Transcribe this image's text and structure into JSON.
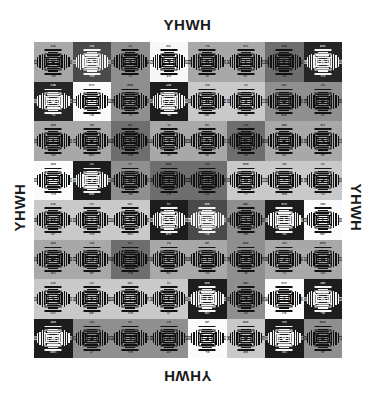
{
  "edge_labels": {
    "top": "YHWH",
    "bottom": "YHWH",
    "left": "YHWH",
    "right": "YHWH"
  },
  "grid": {
    "rows": 8,
    "columns": 8,
    "total_cells": 64,
    "description": "8 by 8 grid of grayscale amulet sigil tiles"
  },
  "palette": {
    "white": "#ffffff",
    "near_white": "#f2f2f2",
    "light_gray": "#c9c9c9",
    "gray": "#a8a8a8",
    "mid_gray": "#8f8f8f",
    "dark_gray": "#6e6e6e",
    "darker_gray": "#4a4a4a",
    "near_black": "#262626",
    "black": "#111111",
    "ink_dark": "#111111",
    "ink_light": "#f5f5f5"
  },
  "cells": [
    {
      "r": 1,
      "c": 1,
      "bg": "#a8a8a8",
      "ink": "#111111",
      "glyph": "א",
      "top": "אבג",
      "bot": "שדי",
      "lnum": "272",
      "rnum": "311"
    },
    {
      "r": 1,
      "c": 2,
      "bg": "#4a4a4a",
      "ink": "#f5f5f5",
      "glyph": "ב",
      "top": "גדה",
      "bot": "אלד",
      "lnum": "118",
      "rnum": "205"
    },
    {
      "r": 1,
      "c": 3,
      "bg": "#8f8f8f",
      "ink": "#111111",
      "glyph": "ג",
      "top": "הוז",
      "bot": "רבי",
      "lnum": "231",
      "rnum": "146"
    },
    {
      "r": 1,
      "c": 4,
      "bg": "#f7f7f7",
      "ink": "#111111",
      "glyph": "ד",
      "top": "זחט",
      "bot": "טיט",
      "lnum": "119",
      "rnum": "333"
    },
    {
      "r": 1,
      "c": 5,
      "bg": "#a8a8a8",
      "ink": "#111111",
      "glyph": "ה",
      "top": "טיכ",
      "bot": "עב",
      "lnum": "214",
      "rnum": "187"
    },
    {
      "r": 1,
      "c": 6,
      "bg": "#a8a8a8",
      "ink": "#111111",
      "glyph": "ו",
      "top": "כלמ",
      "bot": "יזא",
      "lnum": "260",
      "rnum": "172"
    },
    {
      "r": 1,
      "c": 7,
      "bg": "#6e6e6e",
      "ink": "#111111",
      "glyph": "ז",
      "top": "מנס",
      "bot": "נוכ",
      "lnum": "188",
      "rnum": "226"
    },
    {
      "r": 1,
      "c": 8,
      "bg": "#262626",
      "ink": "#f5f5f5",
      "glyph": "ח",
      "top": "סעפ",
      "bot": "הדר",
      "lnum": "141",
      "rnum": "290"
    },
    {
      "r": 2,
      "c": 1,
      "bg": "#262626",
      "ink": "#f5f5f5",
      "glyph": "ט",
      "top": "פצק",
      "bot": "ברי",
      "lnum": "203",
      "rnum": "155"
    },
    {
      "r": 2,
      "c": 2,
      "bg": "#fbfbfb",
      "ink": "#111111",
      "glyph": "י",
      "top": "קרש",
      "bot": "אלו",
      "lnum": "170",
      "rnum": "238"
    },
    {
      "r": 2,
      "c": 3,
      "bg": "#8f8f8f",
      "ink": "#111111",
      "glyph": "כ",
      "top": "שתא",
      "bot": "ולי",
      "lnum": "246",
      "rnum": "193"
    },
    {
      "r": 2,
      "c": 4,
      "bg": "#1d1d1d",
      "ink": "#f5f5f5",
      "glyph": "ל",
      "top": "אבג",
      "bot": "עכי",
      "lnum": "137",
      "rnum": "284"
    },
    {
      "r": 2,
      "c": 5,
      "bg": "#c9c9c9",
      "ink": "#111111",
      "glyph": "מ",
      "top": "גדה",
      "bot": "ישא",
      "lnum": "221",
      "rnum": "164"
    },
    {
      "r": 2,
      "c": 6,
      "bg": "#c9c9c9",
      "ink": "#111111",
      "glyph": "נ",
      "top": "הוז",
      "bot": "צב",
      "lnum": "199",
      "rnum": "275"
    },
    {
      "r": 2,
      "c": 7,
      "bg": "#8f8f8f",
      "ink": "#111111",
      "glyph": "ס",
      "top": "זחט",
      "bot": "אנפ",
      "lnum": "158",
      "rnum": "212"
    },
    {
      "r": 2,
      "c": 8,
      "bg": "#8f8f8f",
      "ink": "#111111",
      "glyph": "ע",
      "top": "טיכ",
      "bot": "והו",
      "lnum": "234",
      "rnum": "180"
    },
    {
      "r": 3,
      "c": 1,
      "bg": "#a8a8a8",
      "ink": "#111111",
      "glyph": "ו",
      "top": "אתג",
      "bot": "האל",
      "lnum": "230",
      "rnum": "191"
    },
    {
      "r": 3,
      "c": 2,
      "bg": "#a8a8a8",
      "ink": "#111111",
      "glyph": "א",
      "top": "שגי",
      "bot": "רתא",
      "lnum": "176",
      "rnum": "243"
    },
    {
      "r": 3,
      "c": 3,
      "bg": "#6e6e6e",
      "ink": "#111111",
      "glyph": "ב",
      "top": "בפו",
      "bot": "אלד",
      "lnum": "264",
      "rnum": "149"
    },
    {
      "r": 3,
      "c": 4,
      "bg": "#a8a8a8",
      "ink": "#111111",
      "glyph": "ד",
      "top": "נגי",
      "bot": "לתי",
      "lnum": "207",
      "rnum": "268"
    },
    {
      "r": 3,
      "c": 5,
      "bg": "#a8a8a8",
      "ink": "#111111",
      "glyph": "ה",
      "top": "ינא",
      "bot": "לאי",
      "lnum": "183",
      "rnum": "225"
    },
    {
      "r": 3,
      "c": 6,
      "bg": "#6e6e6e",
      "ink": "#111111",
      "glyph": "ה",
      "top": "צבה",
      "bot": "ונה",
      "lnum": "251",
      "rnum": "166"
    },
    {
      "r": 3,
      "c": 7,
      "bg": "#a8a8a8",
      "ink": "#111111",
      "glyph": "א",
      "top": "אמג",
      "bot": "הוג",
      "lnum": "195",
      "rnum": "239"
    },
    {
      "r": 3,
      "c": 8,
      "bg": "#a8a8a8",
      "ink": "#111111",
      "glyph": "כ",
      "top": "דוא",
      "bot": "ישד",
      "lnum": "228",
      "rnum": "173"
    },
    {
      "r": 4,
      "c": 1,
      "bg": "#fbfbfb",
      "ink": "#111111",
      "glyph": "י",
      "top": "אתג",
      "bot": "אלד",
      "lnum": "139",
      "rnum": "216"
    },
    {
      "r": 4,
      "c": 2,
      "bg": "#1d1d1d",
      "ink": "#f5f5f5",
      "glyph": "ל",
      "top": "הוז",
      "bot": "מנס",
      "lnum": "248",
      "rnum": "161"
    },
    {
      "r": 4,
      "c": 3,
      "bg": "#8f8f8f",
      "ink": "#111111",
      "glyph": "מ",
      "top": "יכל",
      "bot": "שור",
      "lnum": "211",
      "rnum": "257"
    },
    {
      "r": 4,
      "c": 4,
      "bg": "#6e6e6e",
      "ink": "#111111",
      "glyph": "נ",
      "top": "סעפ",
      "bot": "איל",
      "lnum": "186",
      "rnum": "229"
    },
    {
      "r": 4,
      "c": 5,
      "bg": "#6e6e6e",
      "ink": "#111111",
      "glyph": "ה",
      "top": "צקר",
      "bot": "יהוה",
      "lnum": "254",
      "rnum": "147"
    },
    {
      "r": 4,
      "c": 6,
      "bg": "#c9c9c9",
      "ink": "#111111",
      "glyph": "מ",
      "top": "שתא",
      "bot": "רזי",
      "lnum": "192",
      "rnum": "271"
    },
    {
      "r": 4,
      "c": 7,
      "bg": "#c9c9c9",
      "ink": "#111111",
      "glyph": "י",
      "top": "בגד",
      "bot": "אשד",
      "lnum": "218",
      "rnum": "168"
    },
    {
      "r": 4,
      "c": 8,
      "bg": "#c9c9c9",
      "ink": "#111111",
      "glyph": "כ",
      "top": "הוו",
      "bot": "ובר",
      "lnum": "241",
      "rnum": "200"
    },
    {
      "r": 5,
      "c": 1,
      "bg": "#c9c9c9",
      "ink": "#111111",
      "glyph": "ש",
      "top": "אבג",
      "bot": "ינא",
      "lnum": "164",
      "rnum": "236"
    },
    {
      "r": 5,
      "c": 2,
      "bg": "#c9c9c9",
      "ink": "#111111",
      "glyph": "י",
      "top": "דהו",
      "bot": "אלד",
      "lnum": "259",
      "rnum": "178"
    },
    {
      "r": 5,
      "c": 3,
      "bg": "#c9c9c9",
      "ink": "#111111",
      "glyph": "ד",
      "top": "זחט",
      "bot": "המא",
      "lnum": "197",
      "rnum": "263"
    },
    {
      "r": 5,
      "c": 4,
      "bg": "#1d1d1d",
      "ink": "#f5f5f5",
      "glyph": "ב",
      "top": "יכל",
      "bot": "לרש",
      "lnum": "152",
      "rnum": "209"
    },
    {
      "r": 5,
      "c": 5,
      "bg": "#4a4a4a",
      "ink": "#f5f5f5",
      "glyph": "א",
      "top": "מנס",
      "bot": "איל",
      "lnum": "244",
      "rnum": "171"
    },
    {
      "r": 5,
      "c": 6,
      "bg": "#8f8f8f",
      "ink": "#111111",
      "glyph": "ג",
      "top": "עפצ",
      "bot": "עשי",
      "lnum": "189",
      "rnum": "253"
    },
    {
      "r": 5,
      "c": 7,
      "bg": "#1d1d1d",
      "ink": "#f5f5f5",
      "glyph": "ו",
      "top": "קרש",
      "bot": "והר",
      "lnum": "266",
      "rnum": "143"
    },
    {
      "r": 5,
      "c": 8,
      "bg": "#fbfbfb",
      "ink": "#111111",
      "glyph": "י",
      "top": "תאב",
      "bot": "ישא",
      "lnum": "224",
      "rnum": "181"
    },
    {
      "r": 6,
      "c": 1,
      "bg": "#a8a8a8",
      "ink": "#111111",
      "glyph": "ש",
      "top": "אתג",
      "bot": "הוא",
      "lnum": "233",
      "rnum": "194"
    },
    {
      "r": 6,
      "c": 2,
      "bg": "#a8a8a8",
      "ink": "#111111",
      "glyph": "ה",
      "top": "גדה",
      "bot": "ישד",
      "lnum": "174",
      "rnum": "247"
    },
    {
      "r": 6,
      "c": 3,
      "bg": "#6e6e6e",
      "ink": "#111111",
      "glyph": "י",
      "top": "וזח",
      "bot": "אלה",
      "lnum": "261",
      "rnum": "156"
    },
    {
      "r": 6,
      "c": 4,
      "bg": "#a8a8a8",
      "ink": "#111111",
      "glyph": "ע",
      "top": "טיכ",
      "bot": "לוא",
      "lnum": "206",
      "rnum": "269"
    },
    {
      "r": 6,
      "c": 5,
      "bg": "#a8a8a8",
      "ink": "#111111",
      "glyph": "ו",
      "top": "למנ",
      "bot": "נהל",
      "lnum": "185",
      "rnum": "222"
    },
    {
      "r": 6,
      "c": 6,
      "bg": "#8f8f8f",
      "ink": "#111111",
      "glyph": "א",
      "top": "סעפ",
      "bot": "צב",
      "lnum": "249",
      "rnum": "167"
    },
    {
      "r": 6,
      "c": 7,
      "bg": "#a8a8a8",
      "ink": "#111111",
      "glyph": "כ",
      "top": "צקר",
      "bot": "הוי",
      "lnum": "198",
      "rnum": "240"
    },
    {
      "r": 6,
      "c": 8,
      "bg": "#a8a8a8",
      "ink": "#111111",
      "glyph": "מ",
      "top": "שתא",
      "bot": "טוב",
      "lnum": "227",
      "rnum": "176"
    },
    {
      "r": 7,
      "c": 1,
      "bg": "#c9c9c9",
      "ink": "#111111",
      "glyph": "ג",
      "top": "אבג",
      "bot": "יהוה",
      "lnum": "159",
      "rnum": "232"
    },
    {
      "r": 7,
      "c": 2,
      "bg": "#c9c9c9",
      "ink": "#111111",
      "glyph": "ו",
      "top": "דהו",
      "bot": "ישט",
      "lnum": "256",
      "rnum": "184"
    },
    {
      "r": 7,
      "c": 3,
      "bg": "#c9c9c9",
      "ink": "#111111",
      "glyph": "י",
      "top": "זחט",
      "bot": "אלד",
      "lnum": "201",
      "rnum": "265"
    },
    {
      "r": 7,
      "c": 4,
      "bg": "#c9c9c9",
      "ink": "#111111",
      "glyph": "ז",
      "top": "יכל",
      "bot": "יהו",
      "lnum": "150",
      "rnum": "213"
    },
    {
      "r": 7,
      "c": 5,
      "bg": "#1d1d1d",
      "ink": "#f5f5f5",
      "glyph": "ו",
      "top": "מנס",
      "bot": "רומ",
      "lnum": "242",
      "rnum": "169"
    },
    {
      "r": 7,
      "c": 6,
      "bg": "#8f8f8f",
      "ink": "#111111",
      "glyph": "ד",
      "top": "עפצ",
      "bot": "נוב",
      "lnum": "190",
      "rnum": "255"
    },
    {
      "r": 7,
      "c": 7,
      "bg": "#fbfbfb",
      "ink": "#111111",
      "glyph": "י",
      "top": "קרש",
      "bot": "אלו",
      "lnum": "267",
      "rnum": "145"
    },
    {
      "r": 7,
      "c": 8,
      "bg": "#1d1d1d",
      "ink": "#f5f5f5",
      "glyph": "מ",
      "top": "תאב",
      "bot": "שדי",
      "lnum": "223",
      "rnum": "179"
    },
    {
      "r": 8,
      "c": 1,
      "bg": "#1d1d1d",
      "ink": "#f5f5f5",
      "glyph": "א",
      "top": "אתג",
      "bot": "השם",
      "lnum": "235",
      "rnum": "196"
    },
    {
      "r": 8,
      "c": 2,
      "bg": "#8f8f8f",
      "ink": "#111111",
      "glyph": "ב",
      "top": "גדה",
      "bot": "יהו",
      "lnum": "175",
      "rnum": "250"
    },
    {
      "r": 8,
      "c": 3,
      "bg": "#8f8f8f",
      "ink": "#111111",
      "glyph": "ד",
      "top": "וזח",
      "bot": "אלד",
      "lnum": "262",
      "rnum": "157"
    },
    {
      "r": 8,
      "c": 4,
      "bg": "#8f8f8f",
      "ink": "#111111",
      "glyph": "ה",
      "top": "טיכ",
      "bot": "הוג",
      "lnum": "204",
      "rnum": "270"
    },
    {
      "r": 8,
      "c": 5,
      "bg": "#fbfbfb",
      "ink": "#111111",
      "glyph": "ב",
      "top": "למנ",
      "bot": "שדי",
      "lnum": "182",
      "rnum": "220"
    },
    {
      "r": 8,
      "c": 6,
      "bg": "#c9c9c9",
      "ink": "#111111",
      "glyph": "פ",
      "top": "סעפ",
      "bot": "משו",
      "lnum": "245",
      "rnum": "163"
    },
    {
      "r": 8,
      "c": 7,
      "bg": "#1d1d1d",
      "ink": "#f5f5f5",
      "glyph": "ט",
      "top": "צקר",
      "bot": "הוה",
      "lnum": "202",
      "rnum": "237"
    },
    {
      "r": 8,
      "c": 8,
      "bg": "#8f8f8f",
      "ink": "#111111",
      "glyph": "ס",
      "top": "שתא",
      "bot": "ישל",
      "lnum": "229",
      "rnum": "177"
    }
  ]
}
